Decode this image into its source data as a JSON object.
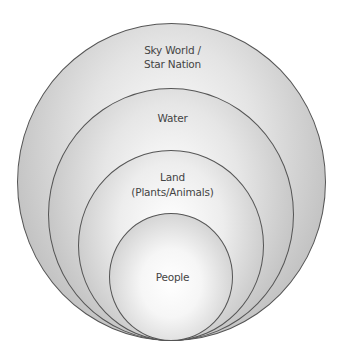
{
  "diagram": {
    "type": "nested-circles",
    "layers": [
      {
        "name": "sky",
        "lines": [
          "Sky World /",
          "Star Nation"
        ]
      },
      {
        "name": "water",
        "lines": [
          "Water"
        ]
      },
      {
        "name": "land",
        "lines": [
          "Land",
          "(Plants/Animals)"
        ]
      },
      {
        "name": "people",
        "lines": [
          "People"
        ]
      }
    ],
    "colors": {
      "outline": "#555555",
      "text": "#444444",
      "fill_center": "#ffffff",
      "fill_edge": "#a9a9a9"
    }
  }
}
